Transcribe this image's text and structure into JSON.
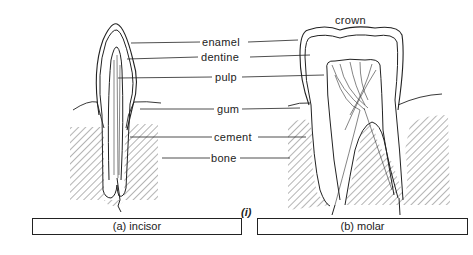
{
  "diagram": {
    "labels": {
      "crown": "crown",
      "enamel": "enamel",
      "dentine": "dentine",
      "pulp": "pulp",
      "gum": "gum",
      "cement": "cement",
      "bone": "bone"
    },
    "figure_label": "(i)",
    "captions": {
      "incisor": "(a) incisor",
      "molar": "(b) molar"
    }
  }
}
